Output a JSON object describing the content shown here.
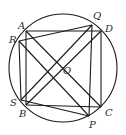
{
  "diagram": {
    "type": "geometry",
    "circle": {
      "cx": 63,
      "cy": 68,
      "r": 54
    },
    "points": {
      "A": {
        "label": "A",
        "x": 26,
        "y": 31,
        "lx": 18,
        "ly": 29
      },
      "R": {
        "label": "R",
        "x": 19,
        "y": 41,
        "lx": 9,
        "ly": 43
      },
      "Q": {
        "label": "Q",
        "x": 92,
        "y": 25,
        "lx": 93,
        "ly": 19
      },
      "D": {
        "label": "D",
        "x": 101,
        "y": 31,
        "lx": 105,
        "ly": 32
      },
      "S": {
        "label": "S",
        "x": 21,
        "y": 100,
        "lx": 10,
        "ly": 106
      },
      "B": {
        "label": "B",
        "x": 26,
        "y": 105,
        "lx": 19,
        "ly": 117
      },
      "C": {
        "label": "C",
        "x": 101,
        "y": 107,
        "lx": 105,
        "ly": 116
      },
      "P": {
        "label": "P",
        "x": 89,
        "y": 116,
        "lx": 89,
        "ly": 128
      },
      "O": {
        "label": "O",
        "x": 57,
        "y": 70,
        "lx": 63,
        "ly": 74
      }
    },
    "segments": [
      [
        "A",
        "D"
      ],
      [
        "D",
        "C"
      ],
      [
        "C",
        "B"
      ],
      [
        "B",
        "A"
      ],
      [
        "A",
        "C"
      ],
      [
        "B",
        "D"
      ],
      [
        "R",
        "Q"
      ],
      [
        "Q",
        "P"
      ],
      [
        "P",
        "S"
      ],
      [
        "S",
        "R"
      ],
      [
        "R",
        "P"
      ],
      [
        "S",
        "Q"
      ]
    ]
  }
}
